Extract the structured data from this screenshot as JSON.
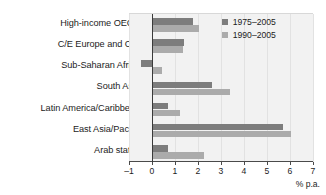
{
  "chart_data": {
    "type": "bar",
    "orientation": "horizontal",
    "title": "",
    "xlabel": "% p.a.",
    "ylabel": "",
    "xlim": [
      -1,
      7
    ],
    "xticks": [
      "-1",
      "0",
      "1",
      "2",
      "3",
      "4",
      "5",
      "6",
      "7"
    ],
    "grid": true,
    "legend_position": "top-right",
    "categories": [
      "High-income OECD",
      "C/E Europe and CIS",
      "Sub-Saharan Africa",
      "South Asia",
      "Latin America/Caribbean",
      "East Asia/Pacific",
      "Arab states"
    ],
    "series": [
      {
        "name": "1975–2005",
        "color": "#7d7d7d",
        "values": [
          1.8,
          1.4,
          -0.5,
          2.6,
          0.7,
          5.7,
          0.7
        ]
      },
      {
        "name": "1990–2005",
        "color": "#ababab",
        "values": [
          2.05,
          1.35,
          0.45,
          3.4,
          1.2,
          6.05,
          2.25
        ]
      }
    ]
  },
  "colors": {
    "series_1975": "#7d7d7d",
    "series_1990": "#ababab",
    "plot_background": "#f2f2f2",
    "axis": "#4a4a4a",
    "text": "#1c1c1c"
  }
}
